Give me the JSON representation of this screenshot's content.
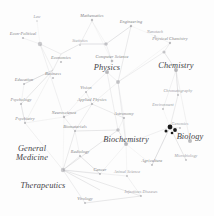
{
  "figure": {
    "type": "network-map",
    "title": "",
    "background_color": "#fdfdfd",
    "edge_color": "#b8b8bc",
    "node_color": "#8a8a90",
    "highlight_node_color": "#1a1a1a",
    "label_color": "#6e6e70"
  },
  "chart_data": {
    "type": "scatter",
    "title": "",
    "xlabel": "",
    "ylabel": "",
    "grid": false,
    "legend": "none",
    "xlim": [
      0,
      214
    ],
    "ylim": [
      0,
      216
    ],
    "nodes": [
      {
        "label": "Law",
        "x": 37,
        "y": 17,
        "tier": "faint",
        "size": 1.3
      },
      {
        "label": "Econ-Political",
        "x": 23,
        "y": 34,
        "tier": "minor",
        "size": 2.2
      },
      {
        "label": "Mathematics",
        "x": 92,
        "y": 16,
        "tier": "minor",
        "size": 2.4
      },
      {
        "label": "Engineering",
        "x": 131,
        "y": 22,
        "tier": "minor",
        "size": 2.4
      },
      {
        "label": "Statistics",
        "x": 80,
        "y": 41,
        "tier": "faint",
        "size": 1.7
      },
      {
        "label": "Economics",
        "x": 61,
        "y": 58,
        "tier": "minor",
        "size": 2.1
      },
      {
        "label": "Computer Science",
        "x": 112,
        "y": 57,
        "tier": "minor",
        "size": 2.6
      },
      {
        "label": "Nanotech",
        "x": 155,
        "y": 32,
        "tier": "faint",
        "size": 1.6
      },
      {
        "label": "Physical Chemistry",
        "x": 170,
        "y": 39,
        "tier": "minor",
        "size": 2.3
      },
      {
        "label": "Chemistry",
        "x": 176,
        "y": 66,
        "tier": "major",
        "size": 4.0
      },
      {
        "label": "Physics",
        "x": 107,
        "y": 68,
        "tier": "major",
        "size": 4.0
      },
      {
        "label": "Business",
        "x": 53,
        "y": 74,
        "tier": "minor",
        "size": 2.1
      },
      {
        "label": "Education",
        "x": 24,
        "y": 80,
        "tier": "minor",
        "size": 2.0
      },
      {
        "label": "Vision",
        "x": 86,
        "y": 88,
        "tier": "minor",
        "size": 2.0
      },
      {
        "label": "Applied Physics",
        "x": 92,
        "y": 100,
        "tier": "minor",
        "size": 2.2
      },
      {
        "label": "Chromatography",
        "x": 178,
        "y": 91,
        "tier": "faint",
        "size": 1.8
      },
      {
        "label": "Psychology",
        "x": 21,
        "y": 100,
        "tier": "minor",
        "size": 2.1
      },
      {
        "label": "Neuroscience",
        "x": 64,
        "y": 113,
        "tier": "minor",
        "size": 2.3
      },
      {
        "label": "Astronomy",
        "x": 124,
        "y": 114,
        "tier": "minor",
        "size": 2.1
      },
      {
        "label": "Environment",
        "x": 163,
        "y": 105,
        "tier": "faint",
        "size": 1.8
      },
      {
        "label": "Psychiatry",
        "x": 25,
        "y": 119,
        "tier": "minor",
        "size": 2.0
      },
      {
        "label": "Biomaterials",
        "x": 75,
        "y": 127,
        "tier": "minor",
        "size": 2.0
      },
      {
        "label": "Genomics",
        "x": 180,
        "y": 124,
        "tier": "faint",
        "size": 1.8
      },
      {
        "label": "Biochemistry",
        "x": 126,
        "y": 140,
        "tier": "major",
        "size": 4.0
      },
      {
        "label": "Biology",
        "x": 190,
        "y": 137,
        "tier": "major",
        "size": 4.0
      },
      {
        "label": "Radiology",
        "x": 80,
        "y": 152,
        "tier": "minor",
        "size": 2.0
      },
      {
        "label": "Microbiology",
        "x": 186,
        "y": 156,
        "tier": "faint",
        "size": 1.8
      },
      {
        "label": "Agriculture",
        "x": 152,
        "y": 161,
        "tier": "minor",
        "size": 1.9
      },
      {
        "label": "Cancer",
        "x": 100,
        "y": 170,
        "tier": "minor",
        "size": 2.0
      },
      {
        "label": "Animal Science",
        "x": 127,
        "y": 172,
        "tier": "faint",
        "size": 1.8
      },
      {
        "label": "Infectious Diseases",
        "x": 141,
        "y": 192,
        "tier": "faint",
        "size": 1.8
      },
      {
        "label": "Virology",
        "x": 85,
        "y": 199,
        "tier": "minor",
        "size": 1.9
      }
    ],
    "cluster_labels": [
      {
        "label": "General Medicine",
        "lines": [
          "General",
          "Medicine"
        ],
        "x": 32,
        "y": 154,
        "tier": "major"
      },
      {
        "label": "Therapeutics",
        "lines": [
          "Therapeutics"
        ],
        "x": 43,
        "y": 186,
        "tier": "major"
      }
    ],
    "highlight_nodes": [
      {
        "x": 170,
        "y": 127,
        "r": 2.4
      },
      {
        "x": 175,
        "y": 130,
        "r": 1.9
      },
      {
        "x": 166,
        "y": 131,
        "r": 1.5
      },
      {
        "x": 172,
        "y": 133,
        "r": 1.3
      }
    ],
    "hubs": [
      {
        "name": "econ-hub",
        "x": 40,
        "y": 44,
        "r": 2.2
      },
      {
        "name": "physics-hub",
        "x": 118,
        "y": 82,
        "r": 2.0
      },
      {
        "name": "medicine-hub",
        "x": 63,
        "y": 170,
        "r": 2.2
      },
      {
        "name": "biochem-hub",
        "x": 118,
        "y": 130,
        "r": 1.8
      },
      {
        "name": "chem-hub",
        "x": 164,
        "y": 52,
        "r": 1.6
      },
      {
        "name": "cs-hub",
        "x": 106,
        "y": 44,
        "r": 1.8
      }
    ],
    "edges": [
      [
        37,
        21,
        40,
        44
      ],
      [
        23,
        38,
        40,
        44
      ],
      [
        40,
        44,
        61,
        54
      ],
      [
        61,
        54,
        80,
        44
      ],
      [
        80,
        44,
        92,
        21
      ],
      [
        92,
        21,
        106,
        44
      ],
      [
        80,
        44,
        106,
        44
      ],
      [
        61,
        54,
        53,
        70
      ],
      [
        53,
        70,
        40,
        44
      ],
      [
        53,
        70,
        24,
        84
      ],
      [
        24,
        84,
        21,
        104
      ],
      [
        21,
        104,
        25,
        123
      ],
      [
        25,
        123,
        53,
        70
      ],
      [
        24,
        84,
        53,
        70
      ],
      [
        21,
        104,
        53,
        70
      ],
      [
        106,
        44,
        112,
        61
      ],
      [
        112,
        61,
        107,
        72
      ],
      [
        107,
        72,
        118,
        82
      ],
      [
        118,
        82,
        131,
        26
      ],
      [
        131,
        26,
        106,
        44
      ],
      [
        131,
        26,
        155,
        36
      ],
      [
        155,
        36,
        170,
        43
      ],
      [
        170,
        43,
        164,
        52
      ],
      [
        164,
        52,
        176,
        70
      ],
      [
        164,
        52,
        118,
        82
      ],
      [
        118,
        82,
        170,
        43
      ],
      [
        107,
        72,
        86,
        92
      ],
      [
        86,
        92,
        92,
        104
      ],
      [
        92,
        104,
        118,
        82
      ],
      [
        92,
        104,
        124,
        118
      ],
      [
        124,
        118,
        118,
        82
      ],
      [
        64,
        117,
        92,
        104
      ],
      [
        64,
        117,
        25,
        123
      ],
      [
        64,
        117,
        75,
        131
      ],
      [
        75,
        131,
        118,
        130
      ],
      [
        118,
        130,
        124,
        118
      ],
      [
        118,
        130,
        126,
        144
      ],
      [
        126,
        144,
        170,
        127
      ],
      [
        170,
        127,
        178,
        95
      ],
      [
        178,
        95,
        176,
        70
      ],
      [
        170,
        127,
        163,
        109
      ],
      [
        163,
        109,
        176,
        70
      ],
      [
        170,
        127,
        180,
        128
      ],
      [
        170,
        127,
        186,
        160
      ],
      [
        170,
        127,
        152,
        165
      ],
      [
        152,
        165,
        126,
        144
      ],
      [
        126,
        144,
        118,
        130
      ],
      [
        63,
        170,
        75,
        131
      ],
      [
        63,
        170,
        25,
        123
      ],
      [
        63,
        170,
        80,
        156
      ],
      [
        80,
        156,
        75,
        131
      ],
      [
        63,
        170,
        100,
        174
      ],
      [
        100,
        174,
        126,
        144
      ],
      [
        63,
        170,
        85,
        203
      ],
      [
        85,
        203,
        141,
        196
      ],
      [
        141,
        196,
        127,
        176
      ],
      [
        127,
        176,
        126,
        144
      ],
      [
        63,
        170,
        127,
        176
      ],
      [
        63,
        170,
        141,
        196
      ],
      [
        100,
        174,
        80,
        156
      ],
      [
        64,
        117,
        63,
        170
      ],
      [
        25,
        123,
        21,
        104
      ],
      [
        118,
        82,
        126,
        144
      ],
      [
        118,
        130,
        63,
        170
      ],
      [
        107,
        72,
        118,
        130
      ],
      [
        112,
        61,
        92,
        21
      ],
      [
        40,
        44,
        64,
        117
      ],
      [
        152,
        165,
        170,
        127
      ],
      [
        176,
        70,
        190,
        141
      ],
      [
        190,
        141,
        170,
        127
      ],
      [
        86,
        92,
        64,
        117
      ],
      [
        92,
        104,
        75,
        131
      ],
      [
        124,
        118,
        126,
        144
      ],
      [
        106,
        44,
        80,
        44
      ],
      [
        63,
        170,
        100,
        190
      ]
    ]
  }
}
